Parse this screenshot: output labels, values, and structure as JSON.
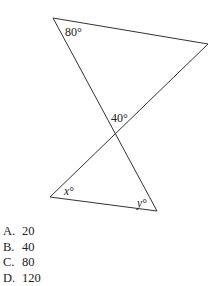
{
  "diagram": {
    "type": "two triangles sharing a vertex (vertical angles)",
    "angle_labels": {
      "top_left": "80°",
      "intersection": "40°",
      "bottom_left": "x°",
      "bottom_right": "y°"
    }
  },
  "choices": [
    {
      "letter": "A.",
      "value": "20"
    },
    {
      "letter": "B.",
      "value": "40"
    },
    {
      "letter": "C.",
      "value": "80"
    },
    {
      "letter": "D.",
      "value": "120"
    }
  ]
}
